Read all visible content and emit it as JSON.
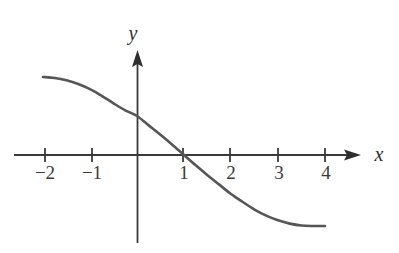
{
  "figure": {
    "background_color": "#ffffff",
    "axis_color": "#3a3a3a",
    "curve_color": "#565656",
    "label_color": "#3a3a3a"
  },
  "axes": {
    "x_axis_name": "x-axis",
    "y_axis_name": "y-axis",
    "x_label": "x",
    "y_label": "y",
    "x_ticks": [
      {
        "value": -2,
        "label": "−2",
        "px": 45
      },
      {
        "value": -1,
        "label": "−1",
        "px": 92
      },
      {
        "value": 1,
        "label": "1",
        "px": 183
      },
      {
        "value": 2,
        "label": "2",
        "px": 230
      },
      {
        "value": 3,
        "label": "3",
        "px": 278
      },
      {
        "value": 4,
        "label": "4",
        "px": 325
      }
    ],
    "y_ticks": [],
    "origin_px": {
      "x": 137,
      "y": 155
    },
    "unit_px": 47,
    "x_axis_start_px": 14,
    "x_axis_arrow_tip_px": 361,
    "y_axis_top_arrow_tip_px": 50,
    "y_axis_bottom_px": 243,
    "tick_half_length_px": 7
  },
  "chart_data": {
    "type": "line",
    "title": "",
    "subtitle": "",
    "xlabel": "x",
    "ylabel": "y",
    "xlim": [
      -2.4,
      4.4
    ],
    "ylim": [
      -1.55,
      1.75
    ],
    "grid": false,
    "legend": null,
    "annotations": [],
    "x_intercept": 1,
    "y_intercept": 0.83,
    "series": [
      {
        "name": "curve",
        "x": [
          -2.0,
          -1.75,
          -1.5,
          -1.25,
          -1.0,
          -0.75,
          -0.5,
          -0.25,
          0.0,
          0.25,
          0.5,
          0.75,
          1.0,
          1.25,
          1.5,
          1.75,
          2.0,
          2.25,
          2.5,
          2.75,
          3.0,
          3.25,
          3.5,
          3.75,
          4.0
        ],
        "y": [
          1.66,
          1.64,
          1.59,
          1.51,
          1.4,
          1.26,
          1.1,
          0.95,
          0.83,
          0.63,
          0.43,
          0.22,
          0.0,
          -0.22,
          -0.43,
          -0.63,
          -0.83,
          -1.0,
          -1.16,
          -1.29,
          -1.39,
          -1.46,
          -1.5,
          -1.51,
          -1.51
        ]
      }
    ]
  },
  "rendering": {
    "curve_path": "M 43,77 C 72,77 94,90 114,105 C 133,118 160,140 183,155 C 206,170 231,190 252,203 C 275,217 302,226 326,227",
    "curve_stroke_width": 2.6,
    "axis_stroke_width": 1.8,
    "tick_stroke_width": 1.8
  }
}
